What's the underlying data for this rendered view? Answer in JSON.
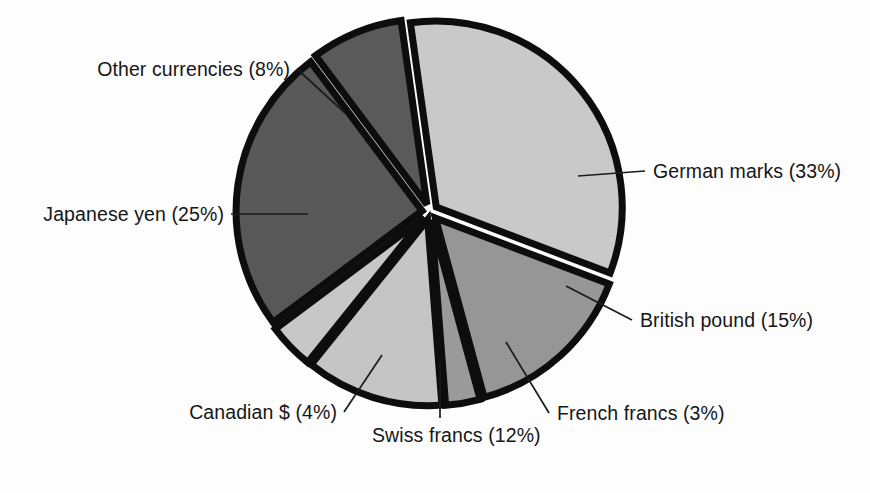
{
  "chart_data": {
    "type": "pie",
    "title": "",
    "subtitle": "",
    "xlabel": "",
    "ylabel": "",
    "legend_position": "none",
    "grid": false,
    "units": "percent",
    "labels": [
      "German marks (33%)",
      "British pound (15%)",
      "French francs (3%)",
      "Swiss francs (12%)",
      "Canadian $ (4%)",
      "Japanese yen (25%)",
      "Other currencies (8%)"
    ],
    "categories": [
      "German marks",
      "British pound",
      "French francs",
      "Swiss francs",
      "Canadian $",
      "Japanese yen",
      "Other currencies"
    ],
    "values": [
      33,
      15,
      3,
      12,
      4,
      25,
      8
    ],
    "total": 100,
    "slice_colors": [
      "#c9c9c9",
      "#969696",
      "#9a9a9a",
      "#c5c5c5",
      "#c7c7c7",
      "#585858",
      "#5a5a5a"
    ],
    "separator_color": "#0d0d0d",
    "background_color": "#fdfdfd",
    "slices": [
      {
        "name": "German marks",
        "value": 33,
        "label": "German marks (33%)",
        "color": "#c9c9c9",
        "start_angle": -8,
        "end_angle": 110.8,
        "explode": 8
      },
      {
        "name": "British pound",
        "value": 15,
        "label": "British pound (15%)",
        "color": "#969696",
        "start_angle": 110.8,
        "end_angle": 164.8,
        "explode": 8
      },
      {
        "name": "French francs",
        "value": 3,
        "label": "French francs (3%)",
        "color": "#9a9a9a",
        "start_angle": 164.8,
        "end_angle": 175.6,
        "explode": 8
      },
      {
        "name": "Swiss francs",
        "value": 12,
        "label": "Swiss francs (12%)",
        "color": "#c5c5c5",
        "start_angle": 175.6,
        "end_angle": 218.8,
        "explode": 8
      },
      {
        "name": "Canadian $",
        "value": 4,
        "label": "Canadian $ (4%)",
        "color": "#c7c7c7",
        "start_angle": 218.8,
        "end_angle": 233.2,
        "explode": 8
      },
      {
        "name": "Japanese yen",
        "value": 25,
        "label": "Japanese yen (25%)",
        "color": "#585858",
        "start_angle": 233.2,
        "end_angle": 323.2,
        "explode": 8
      },
      {
        "name": "Other currencies",
        "value": 8,
        "label": "Other currencies (8%)",
        "color": "#5a5a5a",
        "start_angle": 323.2,
        "end_angle": 352,
        "explode": 8
      }
    ],
    "geometry": {
      "center_x": 430,
      "center_y": 212,
      "radius": 186
    }
  },
  "labels": {
    "other_currencies": "Other currencies (8%)",
    "german_marks": "German marks (33%)",
    "japanese_yen": "Japanese yen (25%)",
    "british_pound": "British pound (15%)",
    "canadian_dollar": "Canadian $ (4%)",
    "swiss_francs": "Swiss francs (12%)",
    "french_francs": "French francs (3%)"
  }
}
